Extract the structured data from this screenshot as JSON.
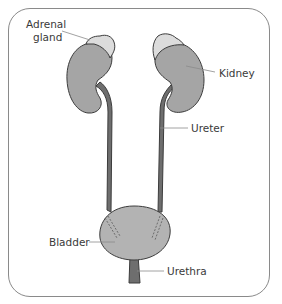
{
  "diagram": {
    "labels": {
      "adrenal_gland_line1": "Adrenal",
      "adrenal_gland_line2": "gland",
      "kidney": "Kidney",
      "ureter": "Ureter",
      "bladder": "Bladder",
      "urethra": "Urethra"
    },
    "colors": {
      "kidney_fill": "#a5a5a5",
      "adrenal_fill": "#dcdcdc",
      "ureter_fill": "#6e6e6e",
      "bladder_fill": "#b3b3b3",
      "outline": "#3c3c3c",
      "leader_line": "#8a8a8a",
      "frame": "#8a8a8a"
    }
  }
}
